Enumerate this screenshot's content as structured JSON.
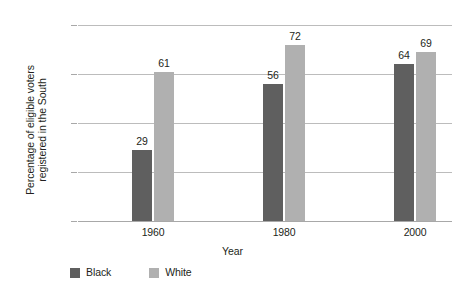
{
  "chart_data": {
    "type": "bar",
    "title": "",
    "subtitle": "",
    "xlabel": "Year",
    "ylabel_line1": "Percentage of eligible voters",
    "ylabel_line2": "registered in the South",
    "categories": [
      "1960",
      "1980",
      "2000"
    ],
    "series": [
      {
        "name": "Black",
        "color": "#5f5f5f",
        "values": [
          29,
          56,
          64
        ]
      },
      {
        "name": "White",
        "color": "#b0b0b0",
        "values": [
          61,
          72,
          69
        ]
      }
    ],
    "ylim": [
      0,
      80
    ],
    "yticks": [
      0,
      20,
      40,
      60,
      80
    ],
    "ytick_labels": [
      "0",
      "20",
      "40",
      "60",
      "80"
    ],
    "grid": true,
    "grid_axis": "y",
    "legend_position": "bottom-left",
    "value_labels": true,
    "background_color": "#ffffff",
    "gridline_color": "#bcbcbc",
    "text_color": "#231f20"
  }
}
